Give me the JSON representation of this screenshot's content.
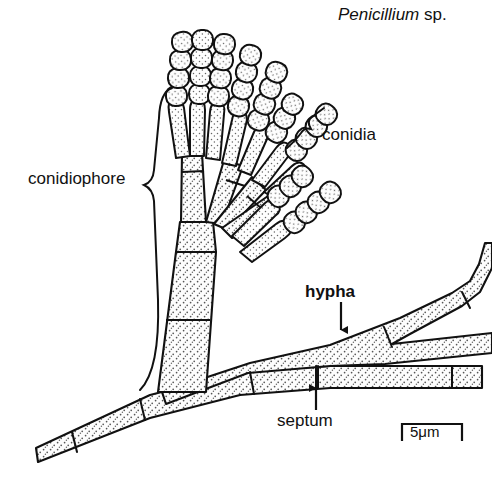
{
  "figure": {
    "type": "scientific-illustration",
    "background_color": "#ffffff",
    "ink_color": "#111111",
    "stipple_fill": "#f4f4f4"
  },
  "title": {
    "genus": "Penicillium",
    "qualifier": " sp."
  },
  "labels": {
    "conidia": "conidia",
    "conidiophore": "conidiophore",
    "hypha": "hypha",
    "septum": "septum"
  },
  "scale_bar": {
    "value": "5",
    "unit": "μm",
    "text": "5μm",
    "length_px": 60
  },
  "annotations": [
    {
      "name": "conidia",
      "text": "conidia",
      "connector": "brace-right",
      "target": "spore-chains"
    },
    {
      "name": "conidiophore",
      "text": "conidiophore",
      "connector": "brace-tall",
      "target": "stipe-and-branches"
    },
    {
      "name": "hypha",
      "text": "hypha",
      "connector": "arrow-down",
      "target": "upper-diagonal-hypha",
      "bold": true
    },
    {
      "name": "septum",
      "text": "septum",
      "connector": "arrow-up",
      "target": "cross-wall-line"
    }
  ],
  "structures": {
    "conidia_chains": 9,
    "phialides": 9,
    "metulae": 4,
    "stipe_septa": 3,
    "hypha_segments": 6
  }
}
